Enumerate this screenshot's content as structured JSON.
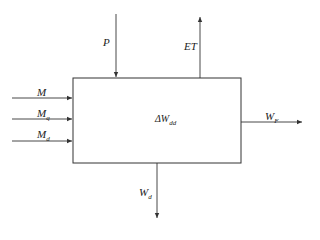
{
  "diagram": {
    "type": "water-balance-block",
    "box": {
      "label_main": "ΔW",
      "label_sub": "dd"
    },
    "inputs_left": [
      {
        "main": "M",
        "sub": ""
      },
      {
        "main": "M",
        "sub": "q"
      },
      {
        "main": "M",
        "sub": "d"
      }
    ],
    "input_top": {
      "main": "P",
      "sub": ""
    },
    "output_top": {
      "main": "ET",
      "sub": ""
    },
    "output_right": {
      "main": "W",
      "sub": "F"
    },
    "output_bottom": {
      "main": "W",
      "sub": "d"
    }
  },
  "colors": {
    "line": "#333333",
    "background": "#ffffff"
  }
}
